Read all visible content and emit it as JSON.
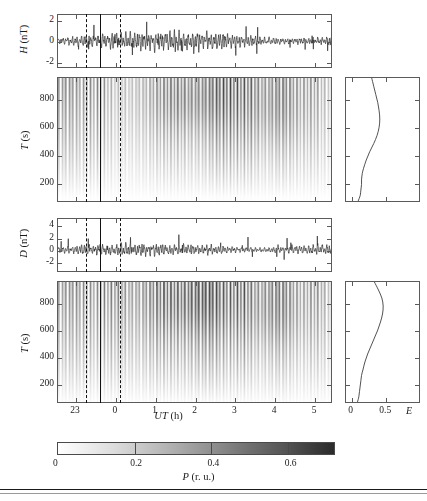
{
  "figure": {
    "title_caption": "",
    "background": "#ffffff",
    "line_color": "#2a2a2a",
    "frame_color": "#5a5a5a",
    "marker_color": "#111111"
  },
  "panels": {
    "h_timeseries": {
      "ylabel_var": "H",
      "ylabel_unit": "(nT)",
      "yticks": [
        "2",
        "0",
        "-2"
      ],
      "ytick_values": [
        2,
        0,
        -2
      ],
      "ylim": [
        -2.6,
        2.6
      ]
    },
    "h_spectrogram": {
      "ylabel_var": "T",
      "ylabel_unit": "(s)",
      "yticks": [
        "800",
        "600",
        "400",
        "200"
      ],
      "ytick_values": [
        800,
        600,
        400,
        200
      ],
      "ylim": [
        60,
        960
      ]
    },
    "d_timeseries": {
      "ylabel_var": "D",
      "ylabel_unit": "(nT)",
      "yticks": [
        "4",
        "2",
        "0",
        "-2"
      ],
      "ytick_values": [
        4,
        2,
        0,
        -2
      ],
      "ylim": [
        -3.6,
        5.2
      ]
    },
    "d_spectrogram": {
      "ylabel_var": "T",
      "ylabel_unit": "(s)",
      "yticks": [
        "800",
        "600",
        "400",
        "200"
      ],
      "ytick_values": [
        800,
        600,
        400,
        200
      ],
      "ylim": [
        60,
        960
      ]
    },
    "shared_x": {
      "label_var": "UT",
      "label_unit": "(h)",
      "ticks": [
        "23",
        "0",
        "1",
        "2",
        "3",
        "4",
        "5"
      ],
      "tick_values": [
        23,
        24,
        25,
        26,
        27,
        28,
        29
      ],
      "xlim": [
        22.55,
        29.45
      ]
    },
    "e_profile_top": {
      "xlabel_var": "E",
      "xticks": [
        "0",
        "0.5"
      ],
      "xtick_values": [
        0,
        0.5
      ],
      "xlim": [
        -0.08,
        1.0
      ]
    },
    "e_profile_bottom": {
      "xlabel_var": "E",
      "xticks": [
        "0",
        "0.5"
      ],
      "xtick_values": [
        0,
        0.5
      ],
      "xlim": [
        -0.08,
        1.0
      ]
    }
  },
  "markers": {
    "solid_line_ut": 23.62,
    "dashed_line_1_ut": 23.27,
    "dashed_line_2_ut": 24.12
  },
  "colorbar": {
    "label_var": "P",
    "label_unit": "(r. u.)",
    "ticks": [
      "0",
      "0.2",
      "0.4",
      "0.6"
    ],
    "tick_values": [
      0,
      0.2,
      0.4,
      0.6
    ],
    "vmin": 0,
    "vmax": 0.72,
    "colormap": "grayscale-reversed"
  },
  "chart_data": {
    "type": "heatmap",
    "title": "",
    "xlabel": "UT (h)",
    "ylabel": "T (s)",
    "legend_position": "bottom",
    "grid": false,
    "colorbar_label": "P (r. u.)",
    "colorbar_range": [
      0,
      0.72
    ],
    "x_axis": {
      "label": "UT (h)",
      "ticks": [
        23,
        0,
        1,
        2,
        3,
        4,
        5
      ],
      "range_hours_ut": [
        22.55,
        29.45
      ]
    },
    "series": [
      {
        "name": "H (nT) timeseries",
        "type": "line",
        "ylabel": "H (nT)",
        "ylim": [
          -2.6,
          2.6
        ],
        "yticks": [
          2,
          0,
          -2
        ],
        "description": "High-frequency geomagnetic pulsation signal, amplitude mostly within +/-1.5 nT with spikes reaching +/-2.5 nT; envelope grows after UT 1.5 h"
      },
      {
        "name": "H wavelet spectrogram",
        "type": "heatmap",
        "ylabel": "T (s)",
        "ylim": [
          60,
          960
        ],
        "yticks": [
          200,
          400,
          600,
          800
        ],
        "description": "Vertical striated power bands; strongest power at T = 600-900 s between UT 2.0 and 3.5 h"
      },
      {
        "name": "D (nT) timeseries",
        "type": "line",
        "ylabel": "D (nT)",
        "ylim": [
          -3.6,
          5.2
        ],
        "yticks": [
          4,
          2,
          0,
          -2
        ],
        "description": "Declination component pulsations, amplitude +/-2 nT typical with maxima near +4.5 nT around UT 2.8 h"
      },
      {
        "name": "D wavelet spectrogram",
        "type": "heatmap",
        "ylabel": "T (s)",
        "ylim": [
          60,
          960
        ],
        "yticks": [
          200,
          400,
          600,
          800
        ],
        "description": "Vertical striated power bands; broad enhancement at T = 500-900 s between UT 1.5 and 3.8 h"
      },
      {
        "name": "E profile (top)",
        "type": "line",
        "xlabel": "E",
        "xlim": [
          -0.08,
          1.0
        ],
        "xticks": [
          0,
          0.5
        ],
        "x_values": [
          0.3,
          0.33,
          0.36,
          0.39,
          0.41,
          0.42,
          0.41,
          0.38,
          0.33,
          0.27,
          0.22,
          0.18,
          0.16,
          0.15,
          0.15,
          0.14,
          0.13,
          0.1
        ],
        "y_values": [
          960,
          900,
          840,
          780,
          720,
          660,
          600,
          540,
          480,
          420,
          360,
          300,
          260,
          220,
          180,
          140,
          100,
          60
        ]
      },
      {
        "name": "E profile (bottom)",
        "type": "line",
        "xlabel": "E",
        "xlim": [
          -0.08,
          1.0
        ],
        "xticks": [
          0,
          0.5
        ],
        "x_values": [
          0.34,
          0.4,
          0.45,
          0.47,
          0.46,
          0.43,
          0.39,
          0.34,
          0.29,
          0.24,
          0.2,
          0.17,
          0.15,
          0.14,
          0.13,
          0.12,
          0.11,
          0.09
        ],
        "y_values": [
          960,
          900,
          840,
          780,
          720,
          660,
          600,
          540,
          480,
          420,
          360,
          300,
          260,
          220,
          180,
          140,
          100,
          60
        ]
      }
    ],
    "annotations": [
      {
        "name": "solid-marker-line",
        "ut": 23.62,
        "style": "solid"
      },
      {
        "name": "dashed-marker-line-1",
        "ut": 23.27,
        "style": "dashed"
      },
      {
        "name": "dashed-marker-line-2",
        "ut": 24.12,
        "style": "dashed"
      }
    ]
  }
}
